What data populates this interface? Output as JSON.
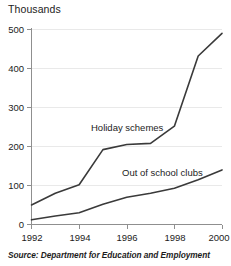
{
  "figure": {
    "title": "Thousands",
    "source": "Source: Department for Education and Employment"
  },
  "axes": {
    "y_ticks": [
      "0",
      "100",
      "200",
      "300",
      "400",
      "500"
    ],
    "x_ticks": [
      "1992",
      "1994",
      "1996",
      "1998",
      "2000"
    ]
  },
  "annotations": {
    "holiday_schemes": "Holiday schemes",
    "out_of_school_clubs": "Out of school clubs"
  },
  "colors": {
    "line": "#3a3a3a",
    "grid": "#e9e9e9",
    "axis": "#8f8f8f",
    "background": "#ffffff",
    "text": "#1c1c1c"
  },
  "chart_data": {
    "type": "line",
    "title": "Thousands",
    "subtitle": "",
    "xlabel": "",
    "ylabel": "Thousands",
    "xlim": [
      1992,
      2000
    ],
    "ylim": [
      0,
      500
    ],
    "grid": true,
    "legend_position": "inline-annotation",
    "y_ticks": [
      0,
      100,
      200,
      300,
      400,
      500
    ],
    "x_ticks": [
      1992,
      1994,
      1996,
      1998,
      2000
    ],
    "x": [
      1992,
      1993,
      1994,
      1995,
      1996,
      1997,
      1998,
      1999,
      2000
    ],
    "series": [
      {
        "name": "Holiday schemes",
        "values": [
          50,
          80,
          102,
          192,
          205,
          208,
          252,
          432,
          490
        ]
      },
      {
        "name": "Out of school clubs",
        "values": [
          12,
          22,
          30,
          52,
          70,
          80,
          93,
          115,
          140
        ]
      }
    ],
    "annotations": [
      {
        "text": "Holiday schemes",
        "x": 1995.6,
        "y": 255
      },
      {
        "text": "Out of school clubs",
        "x": 1996.5,
        "y": 155
      }
    ]
  }
}
